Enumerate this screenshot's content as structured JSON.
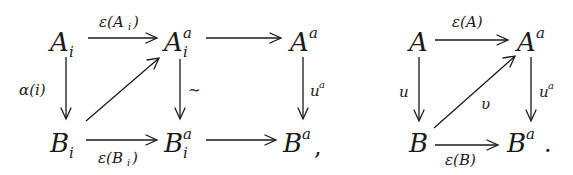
{
  "diagram_left": {
    "nodes": {
      "A_i": {
        "base": "A",
        "sub": "i",
        "sup": ""
      },
      "A_i_a": {
        "base": "A",
        "sub": "i",
        "sup": "a"
      },
      "A_a": {
        "base": "A",
        "sub": "",
        "sup": "a"
      },
      "B_i": {
        "base": "B",
        "sub": "i",
        "sup": ""
      },
      "B_i_a": {
        "base": "B",
        "sub": "i",
        "sup": "a"
      },
      "B_a": {
        "base": "B",
        "sub": "",
        "sup": "a"
      }
    },
    "labels": {
      "top_left": "ε(A",
      "top_left_sub": "i",
      "top_left_close": ")",
      "bottom_left": "ε(B",
      "bottom_left_sub": "i",
      "bottom_left_close": ")",
      "left_vertical": "α(i)",
      "middle_vertical": "∼",
      "right_vertical": "u",
      "right_vertical_sup": "a"
    },
    "trailing_punct": ","
  },
  "diagram_right": {
    "nodes": {
      "A": {
        "base": "A"
      },
      "A_a": {
        "base": "A",
        "sup": "a"
      },
      "B": {
        "base": "B"
      },
      "B_a": {
        "base": "B",
        "sup": "a"
      }
    },
    "labels": {
      "top": "ε(A)",
      "bottom": "ε(B)",
      "left_vertical": "u",
      "diagonal": "υ",
      "right_vertical": "u",
      "right_vertical_sup": "a"
    },
    "trailing_punct": "."
  }
}
